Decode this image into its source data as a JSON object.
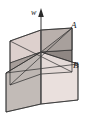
{
  "figure": {
    "type": "3d-geometry-diagram",
    "background_color": "#ffffff",
    "width": 87,
    "height": 120
  },
  "axis": {
    "name": "w",
    "label": "w",
    "label_x": 33,
    "label_y": 13,
    "arrow_direction": "up",
    "line_color": "#4a4a4a",
    "top_x": 41,
    "top_y": 10,
    "bottom_x": 41,
    "bottom_y": 104
  },
  "labels": [
    {
      "id": "plane-a",
      "text": "A",
      "x": 74,
      "y": 26,
      "color": "#1a1a1a"
    },
    {
      "id": "plane-b",
      "text": "B",
      "x": 76,
      "y": 66,
      "color": "#1a1a1a"
    }
  ],
  "planes": [
    {
      "id": "plane-a",
      "label": "A",
      "fill_upper": "#b5aaa6",
      "fill_lower": "#e7ddda",
      "edge_color": "#2b2b2b",
      "orientation": "left-front to right-back"
    },
    {
      "id": "plane-b",
      "label": "B",
      "fill_upper": "#cfc6c2",
      "fill_lower": "#8f8986",
      "edge_color": "#2b2b2b",
      "orientation": "right-front to left-back"
    }
  ],
  "colors": {
    "plane_light_pink": "#ded2cf",
    "plane_mid_gray": "#a9a09c",
    "plane_dark_gray": "#8a8380",
    "plane_pale": "#ece4e1",
    "edge_stroke": "#2b2b2b",
    "axis_stroke": "#4a4a4a",
    "text": "#1a1a1a"
  },
  "intersection": {
    "x": 41,
    "y": 52,
    "label": "center-intersection"
  }
}
